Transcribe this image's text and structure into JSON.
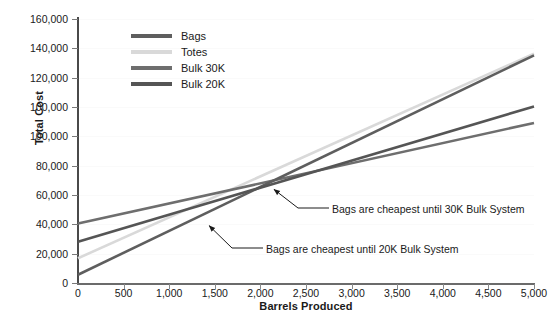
{
  "chart_data": {
    "type": "line",
    "title": "",
    "xlabel": "Barrels Produced",
    "ylabel": "Total Cost",
    "xlim": [
      0,
      5000
    ],
    "ylim": [
      0,
      160000
    ],
    "grid": true,
    "legend_position": "top-left",
    "x_ticks": [
      "0",
      "500",
      "1,000",
      "1,500",
      "2,000",
      "2,500",
      "3,000",
      "3,500",
      "4,000",
      "4,500",
      "5,000"
    ],
    "x_tick_values": [
      0,
      500,
      1000,
      1500,
      2000,
      2500,
      3000,
      3500,
      4000,
      4500,
      5000
    ],
    "y_ticks": [
      "160,000",
      "140,000",
      "120,000",
      "100,000",
      "100,000",
      "80,000",
      "60,000",
      "40,000",
      "20,000",
      "0"
    ],
    "y_tick_values": [
      160000,
      140000,
      120000,
      100000,
      100000,
      80000,
      60000,
      40000,
      20000,
      0
    ],
    "x": [
      0,
      5000
    ],
    "series": [
      {
        "name": "Bags",
        "color": "#5e5e5e",
        "values": [
          5000,
          138000
        ],
        "intercept": 5000,
        "slope_per_barrel": 26.6
      },
      {
        "name": "Totes",
        "color": "#d9d9d9",
        "values": [
          15000,
          139000
        ],
        "intercept": 15000,
        "slope_per_barrel": 24.8
      },
      {
        "name": "Bulk 30K",
        "color": "#6e6e6e",
        "values": [
          36000,
          97000
        ],
        "intercept": 36000,
        "slope_per_barrel": 12.2
      },
      {
        "name": "Bulk 20K",
        "color": "#555555",
        "values": [
          25000,
          107000
        ],
        "intercept": 25000,
        "slope_per_barrel": 16.4
      }
    ],
    "annotations": [
      {
        "text": "Bags are cheapest until 30K Bulk System",
        "points_to_x": 2050,
        "points_to_y": 64000
      },
      {
        "text": "Bags are cheapest until 20K Bulk System",
        "points_to_x": 1350,
        "points_to_y": 42000
      }
    ]
  },
  "legend": {
    "items": [
      {
        "label": "Bags"
      },
      {
        "label": "Totes"
      },
      {
        "label": "Bulk 30K"
      },
      {
        "label": "Bulk 20K"
      }
    ]
  }
}
